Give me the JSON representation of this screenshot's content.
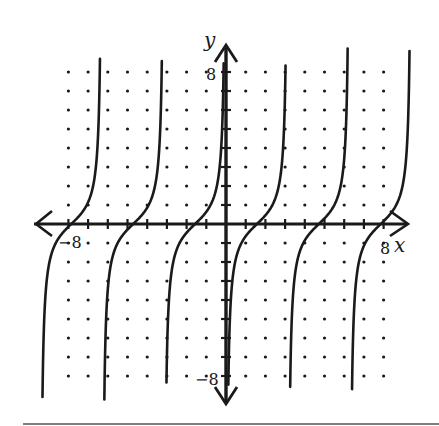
{
  "chart_data": {
    "type": "line",
    "title": "",
    "function": "y = -cot(x)",
    "xlabel": "x",
    "ylabel": "y",
    "xlim": [
      -9.4,
      9.4
    ],
    "ylim": [
      -9.2,
      9.2
    ],
    "grid": "dotted (integer lattice points)",
    "grid_range": {
      "x": [
        -8,
        8
      ],
      "y": [
        -8,
        8
      ]
    },
    "tick_labels": {
      "x": [
        {
          "value": -8,
          "label": "−8"
        },
        {
          "value": 8,
          "label": "8"
        }
      ],
      "y": [
        {
          "value": 8,
          "label": "8"
        },
        {
          "value": -8,
          "label": "−8"
        }
      ]
    },
    "asymptotes_x": [
      -9.42,
      -6.28,
      -3.14,
      0,
      3.14,
      6.28,
      9.42
    ],
    "zeros_x": [
      -7.85,
      -4.71,
      -1.57,
      1.57,
      4.71,
      7.85
    ],
    "branches": [
      {
        "from_x": -9.42,
        "to_x": -6.28,
        "zero": -7.85
      },
      {
        "from_x": -6.28,
        "to_x": -3.14,
        "zero": -4.71
      },
      {
        "from_x": -3.14,
        "to_x": 0,
        "zero": -1.57
      },
      {
        "from_x": 0,
        "to_x": 3.14,
        "zero": 1.57
      },
      {
        "from_x": 3.14,
        "to_x": 6.28,
        "zero": 4.71
      },
      {
        "from_x": 6.28,
        "to_x": 9.42,
        "zero": 7.85
      }
    ],
    "legend": []
  },
  "labels": {
    "x_axis": "x",
    "y_axis": "y",
    "x_min_tick": "−8",
    "x_max_tick": "8",
    "y_max_tick": "8",
    "y_min_tick": "−8"
  },
  "colors": {
    "ink": "#1a1a1a",
    "background": "#ffffff"
  }
}
